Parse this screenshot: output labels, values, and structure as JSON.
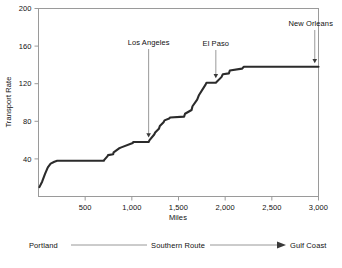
{
  "chart_data": {
    "type": "line",
    "title": "",
    "xlabel": "Miles",
    "ylabel": "Transport Rate",
    "xlim": [
      0,
      3000
    ],
    "ylim": [
      0,
      200
    ],
    "grid": false,
    "legend": "none",
    "xticks": [
      500,
      1000,
      1500,
      2000,
      2500,
      3000
    ],
    "xtick_labels": [
      "500",
      "1,000",
      "1,500",
      "2,000",
      "2,500",
      "3,000"
    ],
    "yticks": [
      40,
      80,
      120,
      160,
      200
    ],
    "ytick_labels": [
      "40",
      "80",
      "120",
      "160",
      "200"
    ],
    "series": [
      {
        "name": "Transport Rate",
        "x": [
          10,
          40,
          70,
          100,
          130,
          170,
          200,
          700,
          705,
          740,
          745,
          800,
          805,
          860,
          880,
          1010,
          1015,
          1180,
          1190,
          1240,
          1250,
          1290,
          1300,
          1340,
          1350,
          1400,
          1410,
          1560,
          1570,
          1640,
          1650,
          1700,
          1720,
          1790,
          1800,
          1900,
          1910,
          1960,
          1975,
          2040,
          2050,
          2180,
          2200,
          3000
        ],
        "y": [
          10,
          16,
          24,
          31,
          35,
          37,
          38,
          38,
          39,
          43,
          44,
          45,
          47,
          51,
          52,
          57,
          58,
          58,
          60,
          66,
          68,
          72,
          75,
          79,
          81,
          83,
          84,
          85,
          88,
          92,
          96,
          103,
          108,
          119,
          121,
          121,
          122,
          127,
          130,
          131,
          134,
          136,
          138,
          138
        ]
      }
    ],
    "annotations": [
      {
        "label": "Los Angeles",
        "x": 1180,
        "y": 59
      },
      {
        "label": "El Paso",
        "x": 1900,
        "y": 122
      },
      {
        "label": "New Orleans",
        "x": 2960,
        "y": 138
      }
    ]
  },
  "route": {
    "start_label": "Portland",
    "middle_label": "Southern Route",
    "end_label": "Gulf Coast"
  },
  "colors": {
    "series": "#2b2b2b",
    "frame": "#9a9a9a",
    "annotation": "#8d8d8d",
    "text": "#111111",
    "background": "#ffffff"
  }
}
